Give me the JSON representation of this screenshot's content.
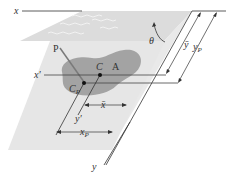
{
  "diagram": {
    "type": "hydrostatic force on inclined submerged plane surface",
    "labels": {
      "x_axis": "x",
      "x_prime": "x′",
      "y_axis": "y",
      "y_prime": "y′",
      "centroid": "C",
      "area": "A",
      "center_of_pressure": "C",
      "center_of_pressure_sub": "P",
      "pressure_line": "P",
      "angle": "θ",
      "y_bar": "ȳ",
      "y_p": "y",
      "y_p_sub": "P",
      "x_bar": "x̄",
      "x_p": "x",
      "x_p_sub": "P"
    },
    "colors": {
      "liquid_surface": "#d9d9d9",
      "plane": "#e8e8e8",
      "area_blob": "#9e9e9e",
      "lines": "#333333",
      "pressure_line": "#7a7a7a"
    }
  }
}
